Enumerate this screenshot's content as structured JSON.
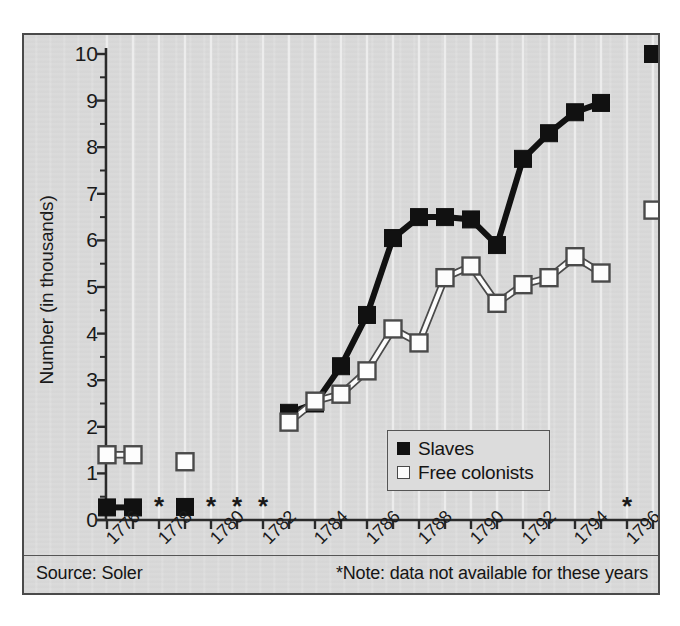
{
  "chart_data": {
    "type": "line",
    "title": "",
    "xlabel": "",
    "ylabel": "Number (in thousands)",
    "ylim": [
      0,
      10
    ],
    "xlim": [
      1775.5,
      1797.5
    ],
    "ytick_labels": [
      "0",
      "1",
      "2",
      "3",
      "4",
      "5",
      "6",
      "7",
      "8",
      "9",
      "10"
    ],
    "ytick_values": [
      0,
      1,
      2,
      3,
      4,
      5,
      6,
      7,
      8,
      9,
      10
    ],
    "yminor_step": 0.5,
    "xtick_labels": [
      "1776",
      "1778",
      "1780",
      "1782",
      "1784",
      "1786",
      "1788",
      "1790",
      "1792",
      "1794",
      "1796"
    ],
    "xtick_values": [
      1776,
      1778,
      1780,
      1782,
      1784,
      1786,
      1788,
      1790,
      1792,
      1794,
      1796
    ],
    "xminor_step": 1,
    "grid": "vertical-only",
    "legend_position": "inside-lower-center",
    "series": [
      {
        "name": "Slaves",
        "marker": "filled-square",
        "color": "#111111",
        "points": [
          {
            "x": 1776,
            "y": 0.27
          },
          {
            "x": 1777,
            "y": 0.27
          },
          {
            "x": 1779,
            "y": 0.28
          },
          {
            "x": 1783,
            "y": 2.3
          },
          {
            "x": 1784,
            "y": 2.5
          },
          {
            "x": 1785,
            "y": 3.3
          },
          {
            "x": 1786,
            "y": 4.4
          },
          {
            "x": 1787,
            "y": 6.05
          },
          {
            "x": 1788,
            "y": 6.5
          },
          {
            "x": 1789,
            "y": 6.5
          },
          {
            "x": 1790,
            "y": 6.45
          },
          {
            "x": 1791,
            "y": 5.9
          },
          {
            "x": 1792,
            "y": 7.75
          },
          {
            "x": 1793,
            "y": 8.3
          },
          {
            "x": 1794,
            "y": 8.75
          },
          {
            "x": 1795,
            "y": 8.95
          },
          {
            "x": 1797,
            "y": 10.0
          }
        ],
        "segments": [
          [
            1776,
            1777
          ],
          [
            1783,
            1795
          ]
        ]
      },
      {
        "name": "Free colonists",
        "marker": "open-square",
        "color": "#fdfdfd",
        "edge_color": "#4a4a4a",
        "points": [
          {
            "x": 1776,
            "y": 1.4
          },
          {
            "x": 1777,
            "y": 1.4
          },
          {
            "x": 1779,
            "y": 1.25
          },
          {
            "x": 1783,
            "y": 2.1
          },
          {
            "x": 1784,
            "y": 2.55
          },
          {
            "x": 1785,
            "y": 2.7
          },
          {
            "x": 1786,
            "y": 3.2
          },
          {
            "x": 1787,
            "y": 4.1
          },
          {
            "x": 1788,
            "y": 3.8
          },
          {
            "x": 1789,
            "y": 5.2
          },
          {
            "x": 1790,
            "y": 5.45
          },
          {
            "x": 1791,
            "y": 4.65
          },
          {
            "x": 1792,
            "y": 5.05
          },
          {
            "x": 1793,
            "y": 5.2
          },
          {
            "x": 1794,
            "y": 5.65
          },
          {
            "x": 1795,
            "y": 5.3
          },
          {
            "x": 1797,
            "y": 6.65
          }
        ],
        "segments": [
          [
            1776,
            1777
          ],
          [
            1783,
            1795
          ]
        ]
      }
    ],
    "annotations": {
      "marker": "*",
      "y": 0.3,
      "years": [
        1778,
        1780,
        1781,
        1782,
        1796
      ],
      "meaning": "data not available for these years"
    }
  },
  "legend": {
    "items": [
      {
        "label": "Slaves",
        "style": "filled"
      },
      {
        "label": "Free colonists",
        "style": "open"
      }
    ]
  },
  "footer": {
    "source": "Source: Soler",
    "note": "*Note: data not available for these years"
  }
}
